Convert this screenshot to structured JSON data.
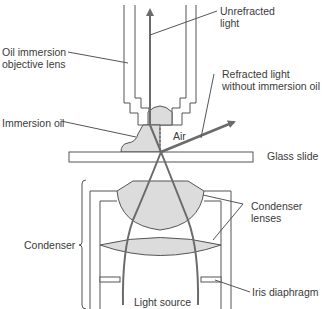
{
  "diagram": {
    "colors": {
      "outline": "#555555",
      "ray": "#6b6b6b",
      "fill": "#dcdcdc",
      "text": "#3a3a3a",
      "background": "#ffffff"
    },
    "labels": {
      "unrefracted_light": "Unrefracted\nlight",
      "oil_immersion_objective": "Oil immersion\nobjective lens",
      "refracted_light": "Refracted light\nwithout immersion oil",
      "immersion_oil": "Immersion oil",
      "air": "Air",
      "glass_slide": "Glass slide",
      "condenser_lenses": "Condenser\nlenses",
      "condenser": "Condenser",
      "iris_diaphragm": "Iris diaphragm",
      "light_source": "Light source"
    }
  }
}
